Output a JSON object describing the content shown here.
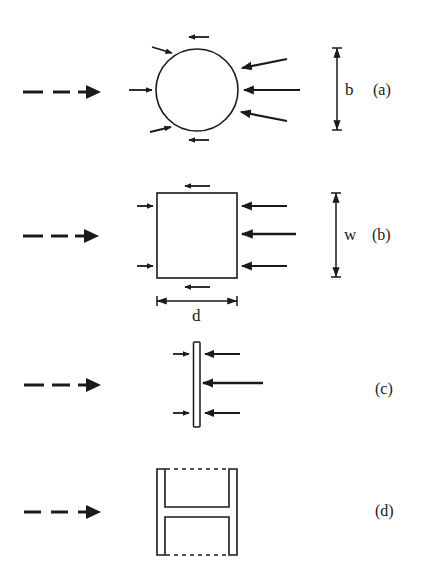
{
  "figure": {
    "panels": [
      {
        "id": "a",
        "label": "(a)",
        "shape": "circular cylinder",
        "dimension_symbol": "b"
      },
      {
        "id": "b",
        "label": "(b)",
        "shape": "square section",
        "dimension_symbol": "w",
        "depth_symbol": "d"
      },
      {
        "id": "c",
        "label": "(c)",
        "shape": "flat plate",
        "dimension_symbol": ""
      },
      {
        "id": "d",
        "label": "(d)",
        "shape": "H-section",
        "dimension_symbol": ""
      }
    ],
    "flow_direction": "left-to-right",
    "colors": {
      "ink": "#1a1a1a",
      "background": "#ffffff"
    }
  }
}
